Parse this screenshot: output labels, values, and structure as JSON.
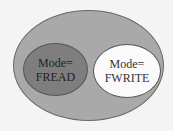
{
  "diagram": {
    "type": "euler",
    "outer_set": {
      "label": "",
      "color": "#a9a9a9"
    },
    "subsets": [
      {
        "line1": "Mode=",
        "line2": "FREAD",
        "color": "#7e7e7e"
      },
      {
        "line1": "Mode=",
        "line2": "FWRITE",
        "color": "#fafafa"
      }
    ]
  }
}
